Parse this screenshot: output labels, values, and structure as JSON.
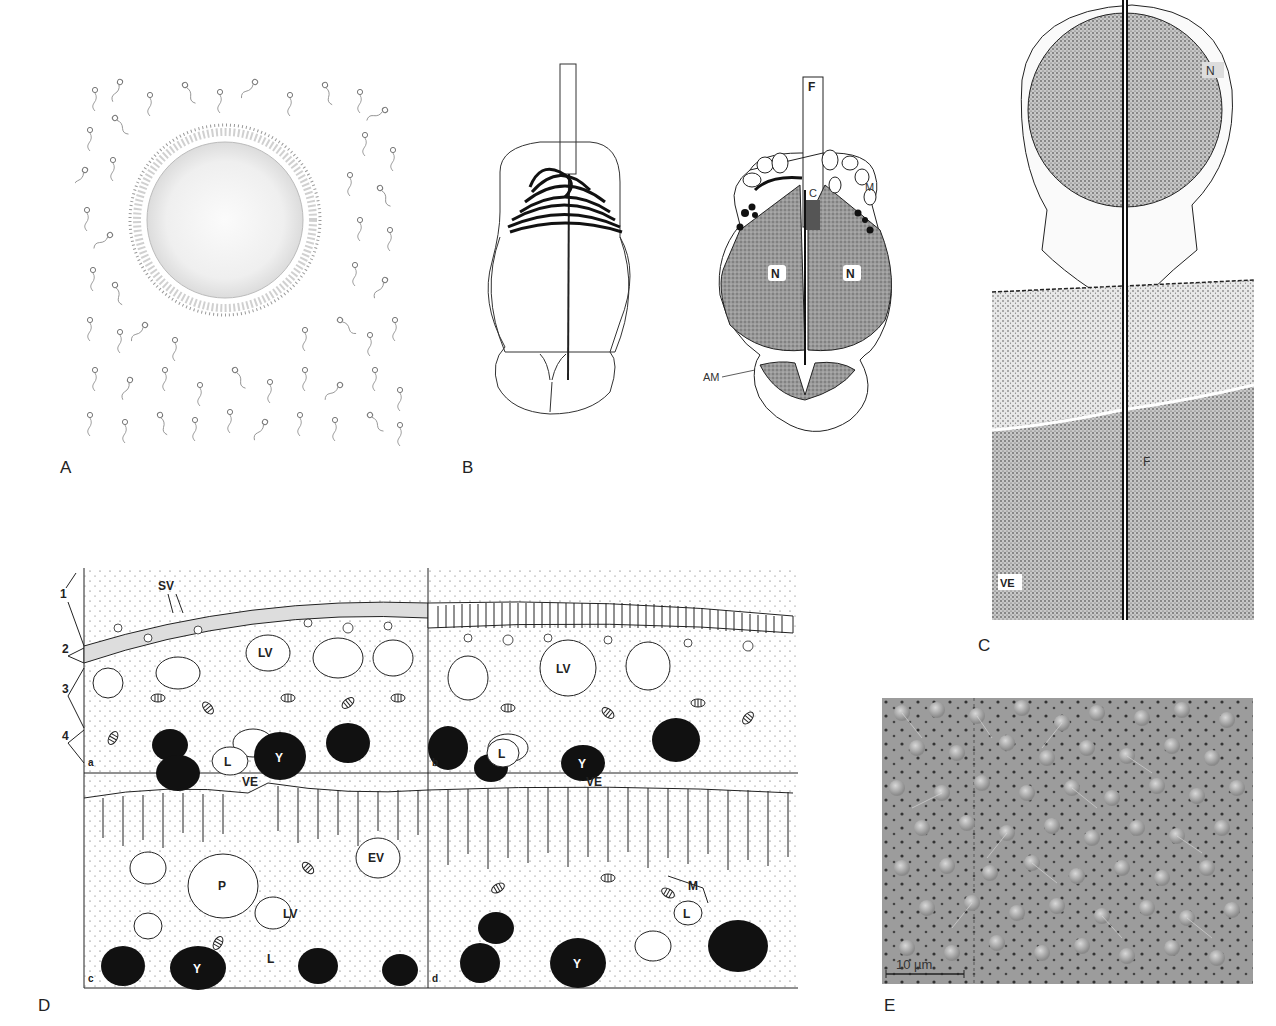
{
  "panels": {
    "A": {
      "letter": "A"
    },
    "B": {
      "letter": "B",
      "labels": {
        "F": "F",
        "C": "C",
        "M": "M",
        "N1": "N",
        "N2": "N",
        "AM": "AM"
      }
    },
    "C": {
      "letter": "C",
      "labels": {
        "N": "N",
        "F": "F",
        "VE": "VE"
      }
    },
    "D": {
      "letter": "D",
      "labels": {
        "SV": "SV",
        "VE1": "VE",
        "VE2": "VE",
        "LV1": "LV",
        "LV2": "LV",
        "LV3": "LV",
        "L1": "L",
        "L2": "L",
        "L3": "L",
        "L4": "L",
        "Y1": "Y",
        "Y2": "Y",
        "Y3": "Y",
        "Y4": "Y",
        "P": "P",
        "EV": "EV",
        "M": "M",
        "n1": "1",
        "n2": "2",
        "n3": "3",
        "n4": "4",
        "a": "a",
        "b": "b",
        "c": "c",
        "d": "d"
      }
    },
    "E": {
      "letter": "E",
      "scalebar": "10 µm"
    }
  }
}
